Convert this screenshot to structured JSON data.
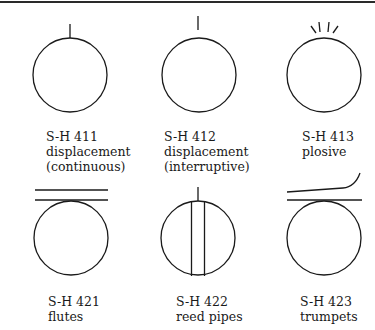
{
  "figure": {
    "items": [
      {
        "code": "S-H 411",
        "lines": [
          "displacement",
          "(continuous)"
        ],
        "symbol": "circle-with-attached-stem"
      },
      {
        "code": "S-H 412",
        "lines": [
          "displacement",
          "(interruptive)"
        ],
        "symbol": "circle-with-detached-stem"
      },
      {
        "code": "S-H 413",
        "lines": [
          "plosive"
        ],
        "symbol": "circle-with-burst-rays"
      },
      {
        "code": "S-H 421",
        "lines": [
          "flutes"
        ],
        "symbol": "circle-with-two-horizontal-lines"
      },
      {
        "code": "S-H 422",
        "lines": [
          "reed pipes"
        ],
        "symbol": "circle-with-reed-and-stem"
      },
      {
        "code": "S-H 423",
        "lines": [
          "trumpets"
        ],
        "symbol": "circle-with-line-and-flared-curve"
      }
    ],
    "stroke_color": "#1a1a1a"
  }
}
